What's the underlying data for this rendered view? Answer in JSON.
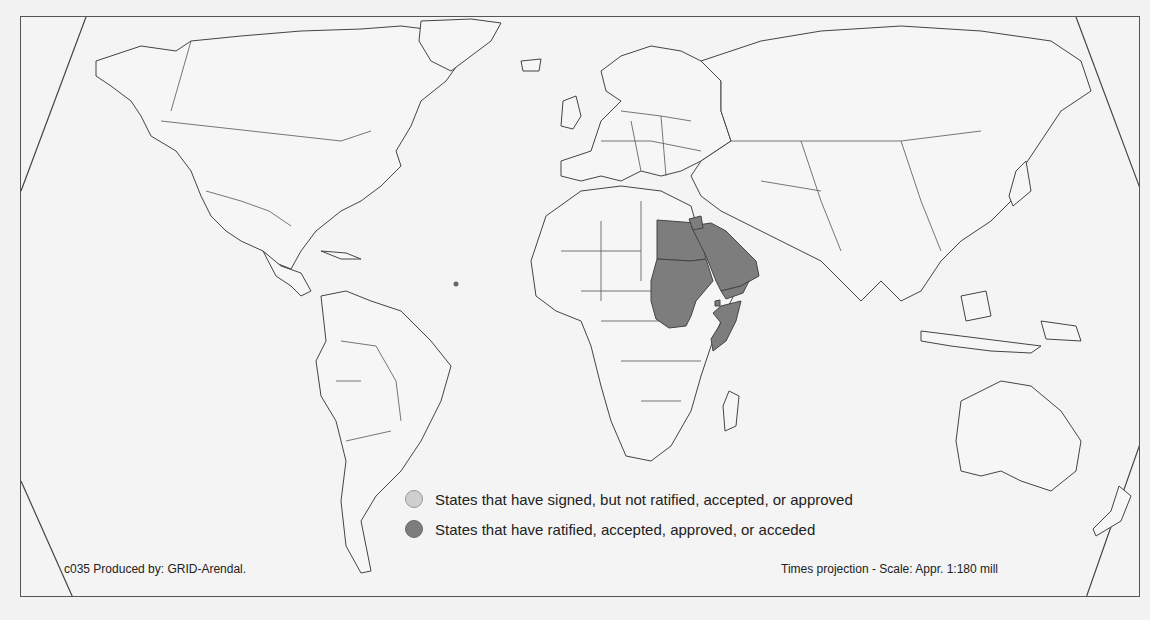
{
  "map": {
    "projection": "Times projection",
    "highlighted_states": {
      "ratified": [
        "Egypt",
        "Sudan",
        "Saudi Arabia",
        "Jordan",
        "Yemen",
        "Djibouti",
        "Somalia"
      ]
    },
    "colors": {
      "background": "#f2f2f2",
      "land": "#f6f6f6",
      "outline": "#444444",
      "signed": "#cfcfcf",
      "ratified": "#7d7d7d"
    }
  },
  "legend": {
    "items": [
      {
        "label": "States that have signed, but not ratified, accepted, or approved",
        "color": "#cfcfcf"
      },
      {
        "label": "States that have ratified, accepted, approved, or acceded",
        "color": "#7d7d7d"
      }
    ]
  },
  "footer": {
    "credit": "c035 Produced by: GRID-Arendal.",
    "scale": "Times projection - Scale: Appr. 1:180 mill"
  }
}
